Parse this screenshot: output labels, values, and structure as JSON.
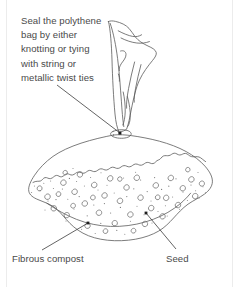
{
  "figure": {
    "type": "line-diagram",
    "background_color": "#ffffff",
    "stroke_color": "#5a5a5a",
    "text_color": "#4a4a4a",
    "width": 242,
    "height": 287
  },
  "annotations": {
    "seal_instruction": {
      "text": "Seal the polythene\nbag by either\nknotting or tying\nwith string or\nmetallic twist ties",
      "leader_from": [
        57,
        85
      ],
      "leader_to": [
        120,
        133
      ],
      "marker_at": [
        120,
        133
      ]
    },
    "fibrous_compost": {
      "text": "Fibrous compost",
      "leader_from": [
        42,
        250
      ],
      "leader_to": [
        88,
        223
      ],
      "marker_at": [
        88,
        223
      ]
    },
    "seed": {
      "text": "Seed",
      "leader_from": [
        176,
        249
      ],
      "leader_to": [
        146,
        213
      ],
      "marker_at": [
        146,
        213
      ]
    }
  },
  "parts": {
    "bag_neck_label": "bag-neck-tie",
    "bag_top_label": "gathered-polythene-top",
    "compost_body_label": "compost-filled-bag-body",
    "compost_surface_label": "fibrous-compost-surface-line"
  }
}
